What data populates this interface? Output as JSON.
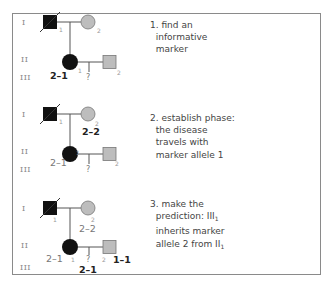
{
  "colors": {
    "affected": "#111111",
    "carrier_gray": "#bdbdbd",
    "line": "#555555",
    "frame": "#8a8a8a"
  },
  "generation_labels": [
    "I",
    "II",
    "III"
  ],
  "panels": [
    {
      "step": "1",
      "text_lines": [
        "1. find an",
        "informative",
        "marker"
      ],
      "individuals": {
        "I1": {
          "sex": "male",
          "status": "affected-deceased",
          "number": "1"
        },
        "I2": {
          "sex": "female",
          "status": "unaffected-gray",
          "number": "2",
          "genotype": ""
        },
        "II1": {
          "sex": "female",
          "status": "affected",
          "number": "1",
          "genotype": "2–1",
          "genotype_bold": true
        },
        "II2": {
          "sex": "male",
          "status": "unaffected-gray",
          "number": "2",
          "genotype": ""
        },
        "III1": {
          "label": "?",
          "genotype": ""
        }
      }
    },
    {
      "step": "2",
      "text_lines": [
        "2. establish phase:",
        "the disease",
        "travels with",
        "marker allele 1"
      ],
      "individuals": {
        "I1": {
          "sex": "male",
          "status": "affected-deceased",
          "number": "1"
        },
        "I2": {
          "sex": "female",
          "status": "unaffected-gray",
          "number": "2",
          "genotype": "2–2",
          "genotype_bold": true
        },
        "II1": {
          "sex": "female",
          "status": "affected",
          "number": "1",
          "genotype": "2–1",
          "genotype_bold": false
        },
        "II2": {
          "sex": "male",
          "status": "unaffected-gray",
          "number": "2",
          "genotype": ""
        },
        "III1": {
          "label": "?",
          "genotype": ""
        }
      }
    },
    {
      "step": "3",
      "text_lines": [
        "3. make the",
        "prediction: III",
        "inherits marker",
        "allele 2 from II"
      ],
      "text_subscripts": {
        "1": "1",
        "3": "1"
      },
      "individuals": {
        "I1": {
          "sex": "male",
          "status": "affected-deceased",
          "number": "1"
        },
        "I2": {
          "sex": "female",
          "status": "unaffected-gray",
          "number": "2",
          "genotype": "2–2",
          "genotype_bold": false
        },
        "II1": {
          "sex": "female",
          "status": "affected",
          "number": "1",
          "genotype": "2–1",
          "genotype_bold": false
        },
        "II2": {
          "sex": "male",
          "status": "unaffected-gray",
          "number": "2",
          "genotype": "1–1",
          "genotype_bold": true
        },
        "III1": {
          "label": "?",
          "genotype": "2–1",
          "genotype_bold": true
        }
      }
    }
  ]
}
